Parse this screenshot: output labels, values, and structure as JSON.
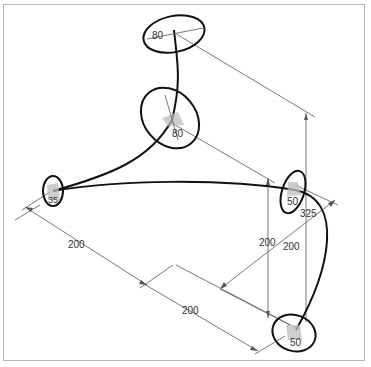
{
  "drawing": {
    "type": "isometric sweep path with profile sections",
    "frame_color": "#b8b8b8",
    "stroke_color": "#111111",
    "dimension_color": "#6a6a6a"
  },
  "sections": [
    {
      "id": "top",
      "label": "80"
    },
    {
      "id": "upper-middle",
      "label": "80"
    },
    {
      "id": "left",
      "label": "35"
    },
    {
      "id": "right",
      "label": "50"
    },
    {
      "id": "bottom",
      "label": "50"
    }
  ],
  "dimensions": {
    "left_lower": "200",
    "bottom_left": "200",
    "vertical_middle": "200",
    "diagonal_right": "200",
    "vertical_right": "325"
  }
}
